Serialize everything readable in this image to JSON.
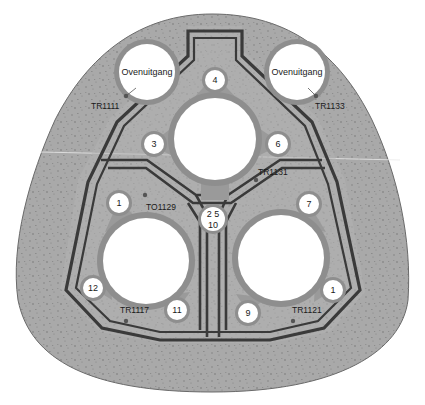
{
  "diagram": {
    "type": "cross-section",
    "colors": {
      "background": "#ffffff",
      "concrete": "#a9a9a9",
      "concrete_speckle": "#7a7a7a",
      "ring": "#8e8e8e",
      "inner_panel": "#b5b5b5",
      "wall_line": "#3a3a3a",
      "opening": "#ffffff",
      "text": "#1a1a1a"
    },
    "exits": [
      {
        "id": "exit-left",
        "label": "Ovenuitgang",
        "cx": 147,
        "cy": 72,
        "r": 33
      },
      {
        "id": "exit-right",
        "label": "Ovenuitgang",
        "cx": 297,
        "cy": 72,
        "r": 33
      }
    ],
    "shafts": [
      {
        "id": "shaft-top",
        "cx": 215,
        "cy": 139,
        "r": 42
      },
      {
        "id": "shaft-left",
        "cx": 146,
        "cy": 261,
        "r": 44
      },
      {
        "id": "shaft-right",
        "cx": 281,
        "cy": 258,
        "r": 44
      }
    ],
    "bolts": [
      {
        "label": "4",
        "cx": 215,
        "cy": 80,
        "r": 10
      },
      {
        "label": "3",
        "cx": 154,
        "cy": 144,
        "r": 10
      },
      {
        "label": "6",
        "cx": 278,
        "cy": 144,
        "r": 10
      },
      {
        "label": "1",
        "cx": 119,
        "cy": 203,
        "r": 10
      },
      {
        "label": "2 5\n10",
        "line1": "2  5",
        "line2": "10",
        "cx": 213,
        "cy": 222,
        "r": 12
      },
      {
        "label": "7",
        "cx": 309,
        "cy": 204,
        "r": 10
      },
      {
        "label": "12",
        "cx": 93,
        "cy": 288,
        "r": 10
      },
      {
        "label": "11",
        "cx": 177,
        "cy": 310,
        "r": 10
      },
      {
        "label": "9",
        "cx": 248,
        "cy": 313,
        "r": 10
      },
      {
        "label": "1",
        "cx": 333,
        "cy": 290,
        "r": 10
      }
    ],
    "tags": [
      {
        "label": "TR1111",
        "x": 91,
        "y": 106,
        "dot": {
          "cx": 126,
          "cy": 96
        }
      },
      {
        "label": "TR1133",
        "x": 315,
        "y": 106,
        "dot": {
          "cx": 316,
          "cy": 96
        }
      },
      {
        "label": "TR1131",
        "x": 258,
        "y": 172,
        "dot": {
          "cx": 256,
          "cy": 180
        }
      },
      {
        "label": "TO1129",
        "x": 146,
        "y": 207,
        "dot": {
          "cx": 145,
          "cy": 195
        }
      },
      {
        "label": "TR1117",
        "x": 120,
        "y": 312,
        "dot": {
          "cx": 126,
          "cy": 321
        }
      },
      {
        "label": "TR1121",
        "x": 292,
        "y": 312,
        "dot": {
          "cx": 293,
          "cy": 321
        }
      }
    ]
  }
}
